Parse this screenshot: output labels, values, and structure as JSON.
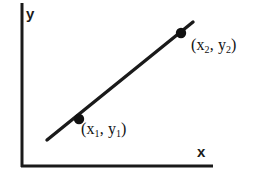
{
  "figure": {
    "background_color": "#ffffff",
    "stroke_color": "#1a1a1a",
    "width": 268,
    "height": 181
  },
  "axes": {
    "x_label": "x",
    "y_label": "y",
    "x_axis": {
      "x1": 21,
      "y1": 166,
      "x2": 213,
      "y2": 166
    },
    "y_axis": {
      "x1": 22,
      "y1": 3,
      "x2": 22,
      "y2": 167
    },
    "stroke_width": 3
  },
  "line": {
    "name": "segment-through-points",
    "x1": 47,
    "y1": 140,
    "x2": 193,
    "y2": 22,
    "stroke_width": 3.4
  },
  "points": [
    {
      "id": "p1",
      "label_x": "x",
      "label_x_sub": "1",
      "label_y": "y",
      "label_y_sub": "1",
      "label_open": "(",
      "label_comma": ",",
      "label_close": ")",
      "cx": 79,
      "cy": 119,
      "r": 5.2
    },
    {
      "id": "p2",
      "label_x": "x",
      "label_x_sub": "2",
      "label_y": "y",
      "label_y_sub": "2",
      "label_open": "(",
      "label_comma": ",",
      "label_close": ")",
      "cx": 181,
      "cy": 33,
      "r": 5.2
    }
  ],
  "chart_data": {
    "type": "line",
    "title": "",
    "xlabel": "x",
    "ylabel": "y",
    "grid": false,
    "legend": null,
    "annotations": [
      "(x1, y1)",
      "(x2, y2)"
    ],
    "series": [
      {
        "name": "line through (x1,y1) and (x2,y2)",
        "points": [
          {
            "label": "(x1, y1)",
            "x": 79,
            "y": 119
          },
          {
            "label": "(x2, y2)",
            "x": 181,
            "y": 33
          }
        ]
      }
    ]
  }
}
